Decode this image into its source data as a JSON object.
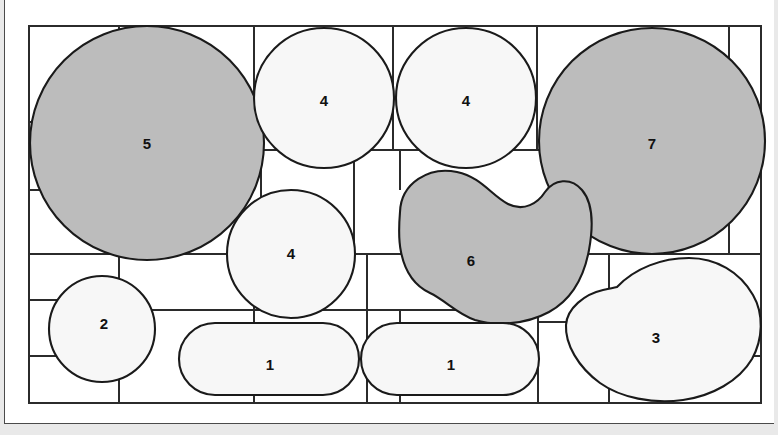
{
  "figure": {
    "title": "",
    "kind": "shape-packing-diagram",
    "background_color": "#e9e9e9",
    "panel_color": "#ffffff",
    "stroke_color": "#1a1a1a",
    "grid_stroke_color": "#2b2b2b",
    "fill_light": "#f7f7f7",
    "fill_gray": "#bcbcbc",
    "panel": {
      "x": 4,
      "y": 0,
      "width": 770,
      "height": 424
    },
    "grid_box": {
      "x": 28,
      "y": 26,
      "width": 732,
      "height": 377
    }
  },
  "grid_lines": {
    "description": "bounding-box partition lines around each packed shape",
    "vertical": [
      {
        "x": 28,
        "y1": 26,
        "y2": 403
      },
      {
        "x": 118,
        "y1": 26,
        "y2": 122
      },
      {
        "x": 118,
        "y1": 150,
        "y2": 254
      },
      {
        "x": 118,
        "y1": 254,
        "y2": 403
      },
      {
        "x": 253,
        "y1": 26,
        "y2": 150
      },
      {
        "x": 253,
        "y1": 254,
        "y2": 403
      },
      {
        "x": 260,
        "y1": 150,
        "y2": 254
      },
      {
        "x": 353,
        "y1": 150,
        "y2": 254
      },
      {
        "x": 392,
        "y1": 26,
        "y2": 150
      },
      {
        "x": 366,
        "y1": 254,
        "y2": 403
      },
      {
        "x": 399,
        "y1": 150,
        "y2": 190
      },
      {
        "x": 399,
        "y1": 310,
        "y2": 403
      },
      {
        "x": 536,
        "y1": 26,
        "y2": 150
      },
      {
        "x": 537,
        "y1": 254,
        "y2": 322
      },
      {
        "x": 537,
        "y1": 322,
        "y2": 403
      },
      {
        "x": 575,
        "y1": 150,
        "y2": 254
      },
      {
        "x": 608,
        "y1": 254,
        "y2": 300
      },
      {
        "x": 608,
        "y1": 356,
        "y2": 403
      },
      {
        "x": 728,
        "y1": 26,
        "y2": 150
      },
      {
        "x": 728,
        "y1": 150,
        "y2": 254
      },
      {
        "x": 760,
        "y1": 26,
        "y2": 403
      }
    ],
    "horizontal": [
      {
        "y": 26,
        "x1": 28,
        "x2": 760
      },
      {
        "y": 122,
        "x1": 28,
        "x2": 118
      },
      {
        "y": 150,
        "x1": 28,
        "x2": 118
      },
      {
        "y": 150,
        "x1": 253,
        "x2": 760
      },
      {
        "y": 190,
        "x1": 28,
        "x2": 118
      },
      {
        "y": 254,
        "x1": 28,
        "x2": 760
      },
      {
        "y": 300,
        "x1": 28,
        "x2": 118
      },
      {
        "y": 310,
        "x1": 118,
        "x2": 537
      },
      {
        "y": 322,
        "x1": 537,
        "x2": 760
      },
      {
        "y": 356,
        "x1": 28,
        "x2": 118
      },
      {
        "y": 356,
        "x1": 728,
        "x2": 760
      },
      {
        "y": 403,
        "x1": 28,
        "x2": 760
      }
    ]
  },
  "shapes": [
    {
      "id": "shape-5",
      "label": "5",
      "geometry": "circle",
      "fill": "gray",
      "cx": 146,
      "cy": 143,
      "r": 117,
      "label_x": 146,
      "label_y": 143
    },
    {
      "id": "shape-4-top-left",
      "label": "4",
      "geometry": "circle",
      "fill": "light",
      "cx": 323,
      "cy": 98,
      "r": 72,
      "label_x": 323,
      "label_y": 100
    },
    {
      "id": "shape-4-top-right",
      "label": "4",
      "geometry": "circle",
      "fill": "light",
      "cx": 465,
      "cy": 98,
      "r": 72,
      "label_x": 465,
      "label_y": 100
    },
    {
      "id": "shape-7",
      "label": "7",
      "geometry": "circle",
      "fill": "gray",
      "cx": 651,
      "cy": 141,
      "r": 113,
      "label_x": 651,
      "label_y": 143
    },
    {
      "id": "shape-4-middle",
      "label": "4",
      "geometry": "circle",
      "fill": "light",
      "cx": 290,
      "cy": 254,
      "r": 65,
      "label_x": 290,
      "label_y": 253
    },
    {
      "id": "shape-6",
      "label": "6",
      "geometry": "bean",
      "fill": "gray",
      "cx": 468,
      "cy": 262,
      "label_x": 468,
      "label_y": 260
    },
    {
      "id": "shape-2",
      "label": "2",
      "geometry": "circle",
      "fill": "light",
      "cx": 101,
      "cy": 329,
      "r": 53,
      "label_x": 101,
      "label_y": 323
    },
    {
      "id": "shape-1-left",
      "label": "1",
      "geometry": "stadium",
      "fill": "light",
      "x": 178,
      "y": 323,
      "width": 180,
      "height": 72,
      "label_x": 268,
      "label_y": 364
    },
    {
      "id": "shape-1-right",
      "label": "1",
      "geometry": "stadium",
      "fill": "light",
      "x": 360,
      "y": 323,
      "width": 178,
      "height": 72,
      "label_x": 449,
      "label_y": 364
    },
    {
      "id": "shape-3",
      "label": "3",
      "geometry": "blob",
      "fill": "light",
      "cx": 652,
      "cy": 330,
      "label_x": 655,
      "label_y": 337
    }
  ]
}
